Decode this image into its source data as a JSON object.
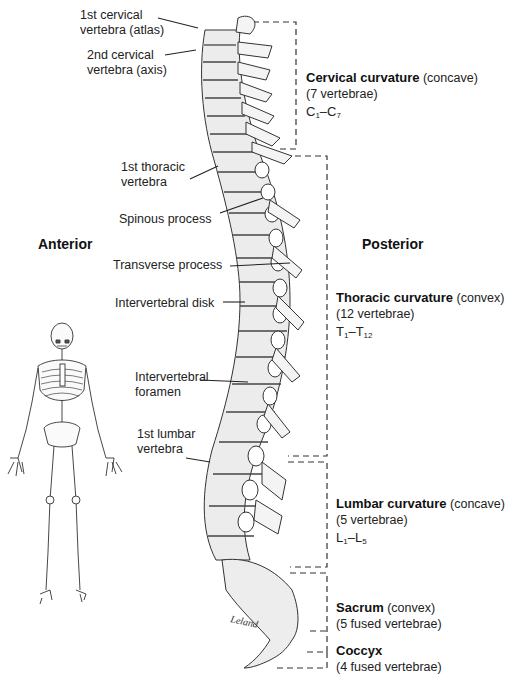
{
  "figure": {
    "orientation_labels": {
      "anterior": "Anterior",
      "posterior": "Posterior"
    },
    "structure_labels": [
      {
        "id": "atlas",
        "line1": "1st cervical",
        "line2": "vertebra (atlas)"
      },
      {
        "id": "axis",
        "line1": "2nd cervical",
        "line2": "vertebra (axis)"
      },
      {
        "id": "first-thoracic",
        "line1": "1st thoracic",
        "line2": "vertebra"
      },
      {
        "id": "spinous-process",
        "line1": "Spinous process"
      },
      {
        "id": "transverse-process",
        "line1": "Transverse process"
      },
      {
        "id": "intervertebral-disk",
        "line1": "Intervertebral disk"
      },
      {
        "id": "intervertebral-foramen",
        "line1": "Intervertebral",
        "line2": "foramen"
      },
      {
        "id": "first-lumbar",
        "line1": "1st lumbar",
        "line2": "vertebra"
      }
    ],
    "regions": [
      {
        "id": "cervical",
        "name": "Cervical curvature",
        "type": "(concave)",
        "count": "(7 vertebrae)",
        "range_letter": "C",
        "range_from": "1",
        "range_to": "7"
      },
      {
        "id": "thoracic",
        "name": "Thoracic curvature",
        "type": "(convex)",
        "count": "(12 vertebrae)",
        "range_letter": "T",
        "range_from": "1",
        "range_to": "12"
      },
      {
        "id": "lumbar",
        "name": "Lumbar curvature",
        "type": "(concave)",
        "count": "(5 vertebrae)",
        "range_letter": "L",
        "range_from": "1",
        "range_to": "5"
      },
      {
        "id": "sacrum",
        "name": "Sacrum",
        "type": "(convex)",
        "count": "(5 fused vertebrae)"
      },
      {
        "id": "coccyx",
        "name": "Coccyx",
        "count": "(4 fused vertebrae)"
      }
    ],
    "signature": "Leland",
    "range_dash": "–",
    "colors": {
      "ink": "#222222",
      "bone_fill": "#ededed",
      "bone_shade": "#cfcfcf",
      "background": "#ffffff"
    }
  }
}
